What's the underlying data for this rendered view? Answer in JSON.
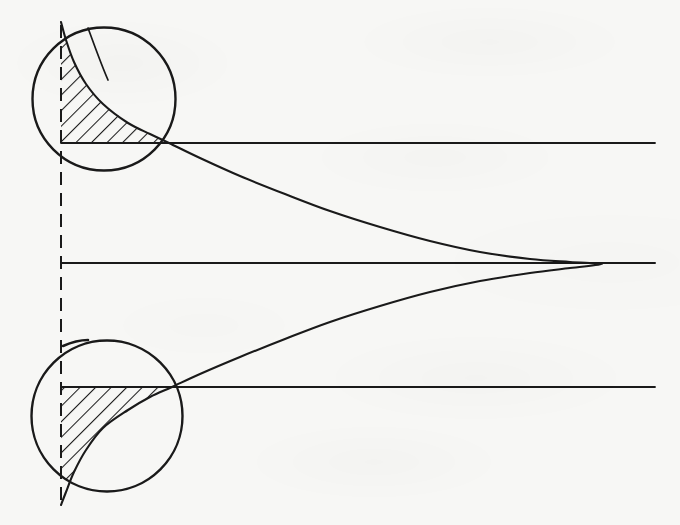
{
  "figure": {
    "kind": "line-drawing",
    "canvas": {
      "width": 680,
      "height": 525
    },
    "background_color": "#f7f7f5",
    "ink_color": "#1a1a1a",
    "hatch_color": "#1a1a1a"
  },
  "chart_data": {
    "type": "line",
    "title": "",
    "subtitle": "",
    "xlabel": "",
    "ylabel": "",
    "orientation": "horizontal-density-rotated-90deg",
    "grid": false,
    "legend": false,
    "axis_lines": [
      {
        "name": "upper-reference-line",
        "y": 143,
        "x_start": 61,
        "x_end": 655,
        "value_label": ""
      },
      {
        "name": "mean-line",
        "y": 263,
        "x_start": 62,
        "x_end": 655,
        "value_label": ""
      },
      {
        "name": "lower-reference-line",
        "y": 387,
        "x_start": 61,
        "x_end": 655,
        "value_label": ""
      }
    ],
    "baseline": {
      "name": "vertical-dashed-baseline",
      "x": 61,
      "y_start": 25,
      "y_end": 500,
      "style": "dashed"
    },
    "peak_point": {
      "x": 602,
      "y": 264
    },
    "curve_points": [
      [
        61,
        22
      ],
      [
        66,
        40
      ],
      [
        74,
        62
      ],
      [
        86,
        84
      ],
      [
        103,
        104
      ],
      [
        128,
        123
      ],
      [
        150,
        134
      ],
      [
        169,
        143
      ],
      [
        200,
        158
      ],
      [
        240,
        176
      ],
      [
        285,
        194
      ],
      [
        330,
        211
      ],
      [
        380,
        227
      ],
      [
        430,
        241
      ],
      [
        480,
        252
      ],
      [
        530,
        259
      ],
      [
        570,
        262
      ],
      [
        602,
        264
      ],
      [
        570,
        268
      ],
      [
        530,
        273
      ],
      [
        480,
        281
      ],
      [
        430,
        292
      ],
      [
        380,
        306
      ],
      [
        330,
        322
      ],
      [
        285,
        339
      ],
      [
        240,
        357
      ],
      [
        200,
        374
      ],
      [
        172,
        387
      ],
      [
        150,
        397
      ],
      [
        128,
        410
      ],
      [
        103,
        428
      ],
      [
        86,
        450
      ],
      [
        74,
        472
      ],
      [
        66,
        492
      ],
      [
        61,
        505
      ]
    ],
    "series": [
      {
        "name": "gaussian-density",
        "style": "solid",
        "width": 2.1
      }
    ],
    "shaded_regions": [
      {
        "name": "upper-tail-area",
        "hatched": true,
        "hatch_angle_deg": 45,
        "bounded_by": [
          "vertical-dashed-baseline",
          "upper-reference-line",
          "gaussian-density"
        ],
        "clipped_to": "upper-magnifier-circle"
      },
      {
        "name": "lower-tail-area",
        "hatched": true,
        "hatch_angle_deg": 45,
        "bounded_by": [
          "vertical-dashed-baseline",
          "lower-reference-line",
          "gaussian-density"
        ],
        "clipped_to": "lower-magnifier-circle"
      }
    ]
  },
  "magnifiers": [
    {
      "name": "upper-magnifier-circle",
      "cx": 104,
      "cy": 99,
      "r": 72
    },
    {
      "name": "lower-magnifier-circle",
      "cx": 107,
      "cy": 416,
      "r": 76
    }
  ],
  "labels": {
    "annotations": [],
    "tick_labels": [],
    "legend_entries": []
  }
}
